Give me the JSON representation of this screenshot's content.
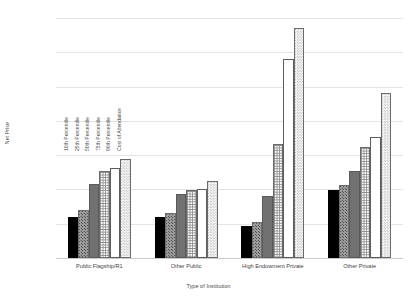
{
  "chart_data": {
    "type": "bar",
    "title": "",
    "xlabel": "Type of Institution",
    "ylabel": "Net Price",
    "categories": [
      "Public Flagship/R1",
      "Other Public",
      "High Endowment Private",
      "Other Private"
    ],
    "series": [
      {
        "name": "10th Percentile",
        "values": [
          12000,
          12000,
          9300,
          19800
        ]
      },
      {
        "name": "25th Percentile",
        "values": [
          14000,
          13000,
          10500,
          21200
        ]
      },
      {
        "name": "50th Percentile",
        "values": [
          21500,
          18800,
          18100,
          25500
        ]
      },
      {
        "name": "75th Percentile",
        "values": [
          25500,
          19700,
          33200,
          32400
        ]
      },
      {
        "name": "90th Percentile",
        "values": [
          26200,
          20000,
          58000,
          35200
        ]
      },
      {
        "name": "Cost of Attendance",
        "values": [
          29000,
          22500,
          67000,
          48000
        ]
      }
    ],
    "ylim": [
      0,
      70000
    ],
    "ytick_values": [
      0,
      10000,
      20000,
      30000,
      40000,
      50000,
      60000,
      70000
    ],
    "ytick_labels": [
      "$0",
      "$10,000",
      "$20,000",
      "$30,000",
      "$40,000",
      "$50,000",
      "$60,000",
      "$70,000"
    ],
    "grid": true,
    "legend_position": "inside-left-vertical"
  }
}
